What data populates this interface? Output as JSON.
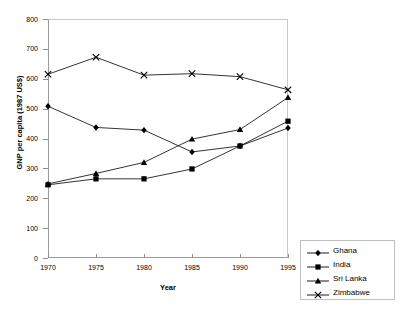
{
  "chart_data": {
    "type": "line",
    "title": "",
    "xlabel": "Year",
    "ylabel": "GNP per capita (1987 US$)",
    "x": [
      1970,
      1975,
      1980,
      1985,
      1990,
      1995
    ],
    "xtick_labels": [
      "1970",
      "1975",
      "1980",
      "1985",
      "1990",
      "1995"
    ],
    "ytick_labels": [
      "0",
      "100",
      "200",
      "300",
      "400",
      "500",
      "600",
      "700",
      "800"
    ],
    "yticks": [
      0,
      100,
      200,
      300,
      400,
      500,
      600,
      700,
      800
    ],
    "xlim": [
      1970,
      1995
    ],
    "ylim": [
      0,
      800
    ],
    "grid": false,
    "legend_position": "right-outside",
    "series": [
      {
        "name": "Ghana",
        "marker": "diamond",
        "values": [
          508,
          437,
          428,
          355,
          375,
          435
        ]
      },
      {
        "name": "India",
        "marker": "square",
        "values": [
          245,
          265,
          265,
          298,
          375,
          458
        ]
      },
      {
        "name": "Sri Lanka",
        "marker": "triangle",
        "values": [
          248,
          283,
          320,
          398,
          430,
          537
        ]
      },
      {
        "name": "Zimbabwe",
        "marker": "cross",
        "values": [
          615,
          672,
          612,
          617,
          607,
          563
        ]
      }
    ]
  },
  "legend": {
    "items": [
      {
        "label": "Ghana",
        "marker": "diamond"
      },
      {
        "label": "India",
        "marker": "square"
      },
      {
        "label": "Sri Lanka",
        "marker": "triangle"
      },
      {
        "label": "Zimbabwe",
        "marker": "cross"
      }
    ]
  },
  "colors": {
    "series": "#000000",
    "axis": "#8f8f8f",
    "frame_light": "#c8c8c8",
    "background": "#ffffff"
  }
}
